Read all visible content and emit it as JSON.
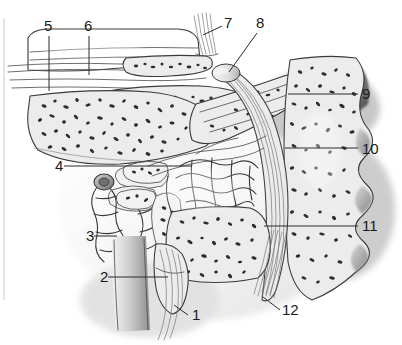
{
  "figure": {
    "width": 402,
    "height": 345,
    "background_color": "#ffffff",
    "ink_color": "#2b2b2b",
    "tissue_fill_color": "#ececec",
    "pale_fill_color": "#f2f2f2",
    "shadow_color": "#8c8c8c",
    "speck_color": "#2e2e2e"
  },
  "labels": [
    {
      "id": "1",
      "text": "1",
      "x": 192,
      "y": 320,
      "anchor": "start"
    },
    {
      "id": "2",
      "text": "2",
      "x": 100,
      "y": 282,
      "anchor": "start"
    },
    {
      "id": "3",
      "text": "3",
      "x": 86,
      "y": 241,
      "anchor": "start"
    },
    {
      "id": "4",
      "text": "4",
      "x": 55,
      "y": 171,
      "anchor": "start"
    },
    {
      "id": "5",
      "text": "5",
      "x": 44,
      "y": 31,
      "anchor": "start"
    },
    {
      "id": "6",
      "text": "6",
      "x": 84,
      "y": 31,
      "anchor": "start"
    },
    {
      "id": "7",
      "text": "7",
      "x": 224,
      "y": 28,
      "anchor": "start"
    },
    {
      "id": "8",
      "text": "8",
      "x": 256,
      "y": 28,
      "anchor": "start"
    },
    {
      "id": "9",
      "text": "9",
      "x": 362,
      "y": 99,
      "anchor": "start"
    },
    {
      "id": "10",
      "text": "10",
      "x": 362,
      "y": 154,
      "anchor": "start"
    },
    {
      "id": "11",
      "text": "11",
      "x": 362,
      "y": 231,
      "anchor": "start"
    },
    {
      "id": "12",
      "text": "12",
      "x": 282,
      "y": 315,
      "anchor": "start"
    }
  ],
  "leader_lines": [
    {
      "for": "1",
      "points": "188,315 174,305"
    },
    {
      "for": "2",
      "points": "108,277 168,277"
    },
    {
      "for": "3",
      "points": "94,236 117,236"
    },
    {
      "for": "4",
      "points": "64,166 192,166"
    },
    {
      "for": "5",
      "points": "49,36 49,91"
    },
    {
      "for": "6",
      "points": "89,36 89,75"
    },
    {
      "for": "7",
      "points": "222,26 203,35"
    },
    {
      "for": "8",
      "points": "257,33 229,72"
    },
    {
      "for": "9",
      "points": "358,94 288,94"
    },
    {
      "for": "10",
      "points": "358,148 285,148"
    },
    {
      "for": "11",
      "points": "358,226 264,226"
    },
    {
      "for": "12",
      "points": "280,310 263,297"
    }
  ]
}
